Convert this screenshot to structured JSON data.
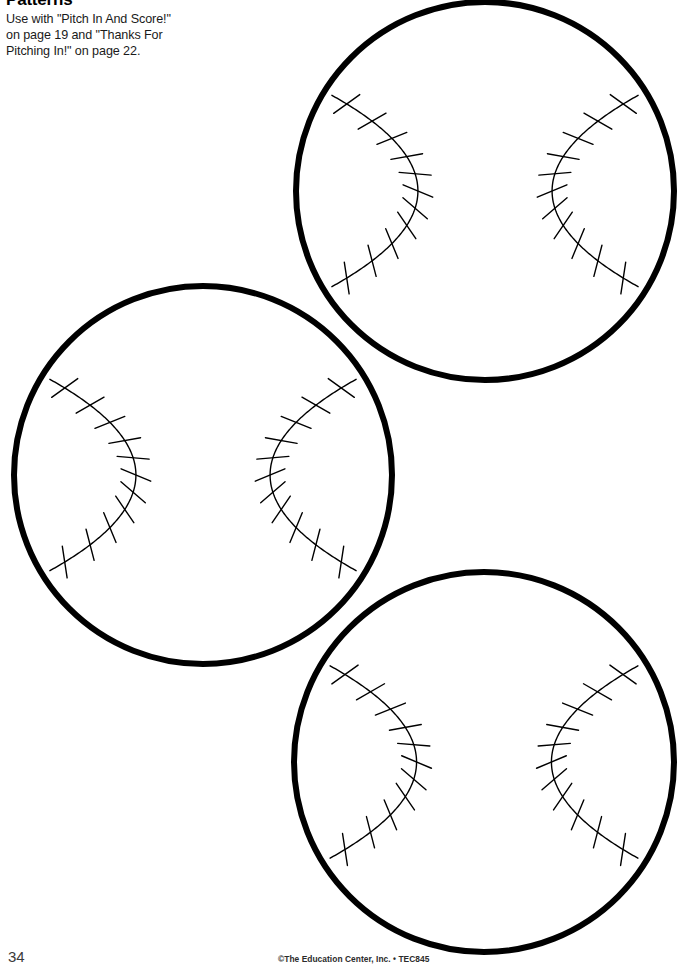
{
  "page": {
    "width": 689,
    "height": 968,
    "background_color": "#ffffff",
    "ink_color": "#000000"
  },
  "header": {
    "title": "Patterns",
    "instructions_line1": "Use with \"Pitch In And Score!\"",
    "instructions_line2": "on page 19 and \"Thanks For",
    "instructions_line3": "Pitching In!\" on page 22."
  },
  "footer": {
    "page_number": "34",
    "copyright": "©The Education Center, Inc. • TEC845"
  },
  "figures": {
    "count": 3,
    "shape_name": "baseball-outline",
    "description": "Blank baseball pattern outlines for cutting out",
    "outline_stroke_width": 6,
    "seam_stroke_width": 1.4,
    "stitches_per_seam": 11,
    "items": [
      {
        "name": "baseball-top-right",
        "left": 294,
        "top": 0,
        "size": 382,
        "center_x": 485,
        "center_y": 191,
        "radius": 189
      },
      {
        "name": "baseball-middle-left",
        "left": 12,
        "top": 284,
        "size": 382,
        "center_x": 203,
        "center_y": 475,
        "radius": 189
      },
      {
        "name": "baseball-bottom-right",
        "left": 293,
        "top": 571,
        "size": 382,
        "center_x": 484,
        "center_y": 762,
        "radius": 190
      }
    ]
  }
}
